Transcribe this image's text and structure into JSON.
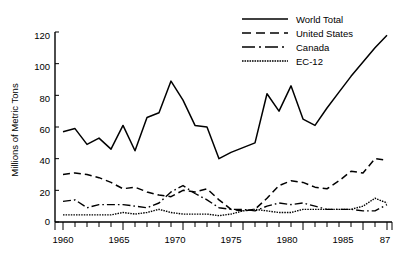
{
  "chart_data": {
    "type": "line",
    "title": "",
    "xlabel": "",
    "ylabel": "Millions of Metric Tons",
    "xlim": [
      1960,
      1987
    ],
    "ylim": [
      0,
      120
    ],
    "grid": false,
    "legend_position": "top-right",
    "y_ticks": [
      0,
      20,
      40,
      60,
      80,
      100,
      120
    ],
    "y_tick_labels": [
      "0",
      "20",
      "40",
      "60",
      "80",
      "100",
      "120"
    ],
    "x_ticks": [
      1960,
      1965,
      1970,
      1975,
      1980,
      1985,
      1987
    ],
    "x_tick_labels": [
      "1960",
      "1965",
      "1970",
      "1975",
      "1980",
      "1985",
      "87"
    ],
    "x_minor_tick_interval": 1,
    "x": [
      1960,
      1961,
      1962,
      1963,
      1964,
      1965,
      1966,
      1967,
      1968,
      1969,
      1970,
      1971,
      1972,
      1973,
      1974,
      1975,
      1976,
      1977,
      1978,
      1979,
      1980,
      1981,
      1982,
      1983,
      1984,
      1985,
      1986,
      1987
    ],
    "series": [
      {
        "name": "World Total",
        "style": "solid",
        "values": [
          57,
          59,
          49,
          53,
          46,
          61,
          45,
          66,
          69,
          89,
          77,
          61,
          60,
          40,
          44,
          47,
          50,
          81,
          70,
          86,
          65,
          61,
          72,
          82,
          92,
          101,
          110,
          118
        ]
      },
      {
        "name": "United States",
        "style": "dashed",
        "values": [
          30,
          31,
          30,
          28,
          25,
          21,
          22,
          19,
          17,
          16,
          20,
          19,
          21,
          14,
          8,
          7,
          8,
          15,
          23,
          26,
          25,
          22,
          21,
          26,
          32,
          31,
          40,
          39
        ]
      },
      {
        "name": "Canada",
        "style": "dashdot",
        "values": [
          13,
          14,
          9,
          11,
          11,
          11,
          10,
          9,
          12,
          19,
          23,
          18,
          14,
          9,
          8,
          8,
          7,
          10,
          12,
          11,
          12,
          10,
          8,
          8,
          8,
          7,
          7,
          11
        ]
      },
      {
        "name": "EC-12",
        "style": "dotted",
        "values": [
          4.5,
          4.5,
          4.5,
          4.5,
          4.5,
          6,
          5,
          6,
          8,
          6,
          5,
          5,
          5,
          4,
          5,
          7,
          8,
          7,
          6,
          6,
          8,
          8,
          8,
          8,
          8,
          10,
          15,
          12
        ]
      }
    ]
  },
  "legend": {
    "entries": [
      {
        "label": "World Total"
      },
      {
        "label": "United States"
      },
      {
        "label": "Canada"
      },
      {
        "label": "EC-12"
      }
    ]
  },
  "colors": {
    "ink": "#000000",
    "background": "#ffffff"
  }
}
